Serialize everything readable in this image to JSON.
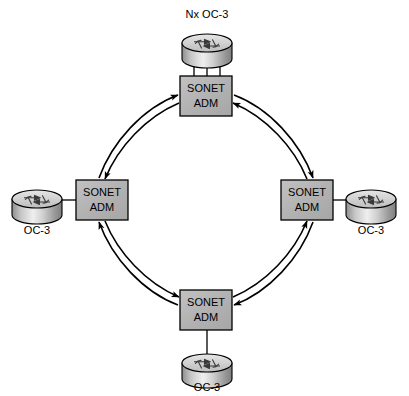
{
  "diagram": {
    "canvas": {
      "width": 409,
      "height": 396
    },
    "colors": {
      "background": "#ffffff",
      "adm_fill": "#b4b4b4",
      "adm_fill_light": "#c8c8c8",
      "adm_stroke": "#000000",
      "router_top": "#d8d8d8",
      "router_body": "#9a9a9a",
      "router_stroke": "#000000",
      "line": "#000000",
      "text": "#000000"
    }
  },
  "adm_nodes": [
    {
      "id": "adm-top",
      "line1": "SONET",
      "line2": "ADM",
      "x": 180,
      "y": 76,
      "w": 52,
      "h": 40
    },
    {
      "id": "adm-left",
      "line1": "SONET",
      "line2": "ADM",
      "x": 76,
      "y": 180,
      "w": 52,
      "h": 40
    },
    {
      "id": "adm-right",
      "line1": "SONET",
      "line2": "ADM",
      "x": 281,
      "y": 180,
      "w": 52,
      "h": 40
    },
    {
      "id": "adm-bottom",
      "line1": "SONET",
      "line2": "ADM",
      "x": 180,
      "y": 290,
      "w": 52,
      "h": 40
    }
  ],
  "routers": [
    {
      "id": "router-top",
      "label": "Nx OC-3",
      "label_position": "above",
      "cx": 207,
      "cy": 43,
      "rx": 25,
      "ry": 9,
      "body_h": 16,
      "links": 3,
      "label_x": 207,
      "label_y": 18
    },
    {
      "id": "router-left",
      "label": "OC-3",
      "label_position": "below",
      "cx": 37,
      "cy": 199,
      "rx": 25,
      "ry": 9,
      "body_h": 16,
      "links": 1,
      "label_x": 37,
      "label_y": 234
    },
    {
      "id": "router-right",
      "label": "OC-3",
      "label_position": "below",
      "cx": 371,
      "cy": 199,
      "rx": 25,
      "ry": 9,
      "body_h": 16,
      "links": 1,
      "label_x": 371,
      "label_y": 234
    },
    {
      "id": "router-bottom",
      "label": "OC-3",
      "label_position": "below",
      "cx": 207,
      "cy": 363,
      "rx": 25,
      "ry": 9,
      "body_h": 16,
      "links": 1,
      "label_x": 207,
      "label_y": 391
    }
  ],
  "access_links": [
    {
      "id": "link-top",
      "from": "router-top",
      "to": "adm-top",
      "count": 3,
      "orientation": "vertical"
    },
    {
      "id": "link-left",
      "from": "router-left",
      "to": "adm-left",
      "count": 1,
      "orientation": "horizontal"
    },
    {
      "id": "link-right",
      "from": "router-right",
      "to": "adm-right",
      "count": 1,
      "orientation": "horizontal"
    },
    {
      "id": "link-bottom",
      "from": "router-bottom",
      "to": "adm-bottom",
      "count": 1,
      "orientation": "vertical"
    }
  ],
  "ring": {
    "description": "Counter-rotating bidirectional SONET ring: two concentric arcs per span with arrowheads at opposite ends.",
    "arcs_per_span": 2,
    "spans": [
      {
        "id": "span-left-top",
        "from": "adm-left",
        "to": "adm-top",
        "quadrant": "upper-left"
      },
      {
        "id": "span-top-right",
        "from": "adm-top",
        "to": "adm-right",
        "quadrant": "upper-right"
      },
      {
        "id": "span-right-bottom",
        "from": "adm-right",
        "to": "adm-bottom",
        "quadrant": "lower-right"
      },
      {
        "id": "span-bottom-left",
        "from": "adm-bottom",
        "to": "adm-left",
        "quadrant": "lower-left"
      }
    ]
  }
}
